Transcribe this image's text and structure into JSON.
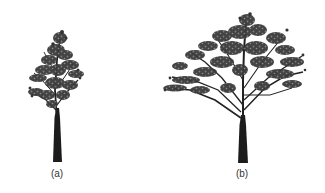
{
  "figure": {
    "panels": [
      {
        "id": "a",
        "label": "(a)",
        "description": "young tree with narrow upright crown",
        "label_x": 57
      },
      {
        "id": "b",
        "label": "(b)",
        "description": "mature tree with wide spreading crown",
        "label_x": 242
      }
    ],
    "colors": {
      "foliage": "#2a2a2a",
      "trunk": "#1e1e1e",
      "background": "#ffffff",
      "caption": "#333333"
    }
  }
}
